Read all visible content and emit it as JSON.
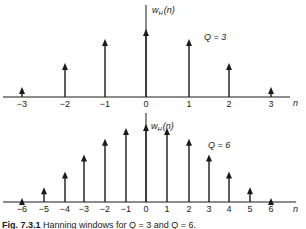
{
  "chart_data": [
    {
      "type": "stem",
      "title": "",
      "ylabel": "w_H(n)",
      "xlabel": "n",
      "annotation": "Q = 3",
      "x": [
        -3,
        -2,
        -1,
        0,
        1,
        2,
        3
      ],
      "values": [
        0.146,
        0.5,
        0.854,
        1.0,
        0.854,
        0.5,
        0.146
      ],
      "tick_labels": [
        "−3",
        "−2",
        "−1",
        "0",
        "1",
        "2",
        "3"
      ],
      "grid": false
    },
    {
      "type": "stem",
      "title": "",
      "ylabel": "w_H(n)",
      "xlabel": "n",
      "annotation": "Q = 6",
      "x": [
        -6,
        -5,
        -4,
        -3,
        -2,
        -1,
        0,
        1,
        2,
        3,
        4,
        5,
        6
      ],
      "values": [
        0.05,
        0.19,
        0.39,
        0.61,
        0.81,
        0.95,
        1.0,
        0.95,
        0.81,
        0.61,
        0.39,
        0.19,
        0.05
      ],
      "tick_labels": [
        "−6",
        "−5",
        "−4",
        "−3",
        "−2",
        "−1",
        "0",
        "1",
        "2",
        "3",
        "4",
        "5",
        "6"
      ],
      "grid": false
    }
  ],
  "top": {
    "ylabel_main": "w",
    "ylabel_sub": "H",
    "ylabel_arg": "(n)",
    "q_label": "Q = 3",
    "n_label": "n"
  },
  "bottom": {
    "ylabel_main": "w",
    "ylabel_sub": "H",
    "ylabel_arg": "(n)",
    "q_label": "Q = 6",
    "n_label": "n"
  },
  "caption": {
    "prefix": "Fig. 7.3.1",
    "text": "Hanning windows for Q = 3 and Q = 6."
  }
}
